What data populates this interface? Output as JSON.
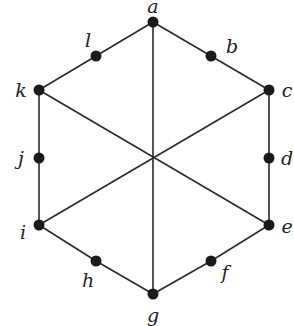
{
  "graph": {
    "nodes": [
      {
        "id": "a",
        "label": "a",
        "x": 153,
        "y": 22,
        "lx": 153,
        "ly": 6
      },
      {
        "id": "b",
        "label": "b",
        "x": 211,
        "y": 56,
        "lx": 232,
        "ly": 46
      },
      {
        "id": "c",
        "label": "c",
        "x": 269,
        "y": 90,
        "lx": 287,
        "ly": 90
      },
      {
        "id": "d",
        "label": "d",
        "x": 269,
        "y": 158,
        "lx": 287,
        "ly": 158
      },
      {
        "id": "e",
        "label": "e",
        "x": 269,
        "y": 225,
        "lx": 287,
        "ly": 226
      },
      {
        "id": "f",
        "label": "f",
        "x": 211,
        "y": 261,
        "lx": 225,
        "ly": 272
      },
      {
        "id": "g",
        "label": "g",
        "x": 153,
        "y": 294,
        "lx": 153,
        "ly": 315
      },
      {
        "id": "h",
        "label": "h",
        "x": 96,
        "y": 261,
        "lx": 88,
        "ly": 280
      },
      {
        "id": "i",
        "label": "i",
        "x": 39,
        "y": 225,
        "lx": 23,
        "ly": 232
      },
      {
        "id": "j",
        "label": "j",
        "x": 39,
        "y": 158,
        "lx": 21,
        "ly": 158
      },
      {
        "id": "k",
        "label": "k",
        "x": 39,
        "y": 90,
        "lx": 21,
        "ly": 90
      },
      {
        "id": "l",
        "label": "l",
        "x": 96,
        "y": 56,
        "lx": 88,
        "ly": 40
      }
    ],
    "edges": [
      [
        "a",
        "b"
      ],
      [
        "b",
        "c"
      ],
      [
        "c",
        "d"
      ],
      [
        "d",
        "e"
      ],
      [
        "e",
        "f"
      ],
      [
        "f",
        "g"
      ],
      [
        "g",
        "h"
      ],
      [
        "h",
        "i"
      ],
      [
        "i",
        "j"
      ],
      [
        "j",
        "k"
      ],
      [
        "k",
        "l"
      ],
      [
        "l",
        "a"
      ],
      [
        "a",
        "g"
      ],
      [
        "k",
        "e"
      ],
      [
        "c",
        "i"
      ]
    ],
    "node_color": "#1a1a1a",
    "edge_color": "#2a2a2a"
  }
}
